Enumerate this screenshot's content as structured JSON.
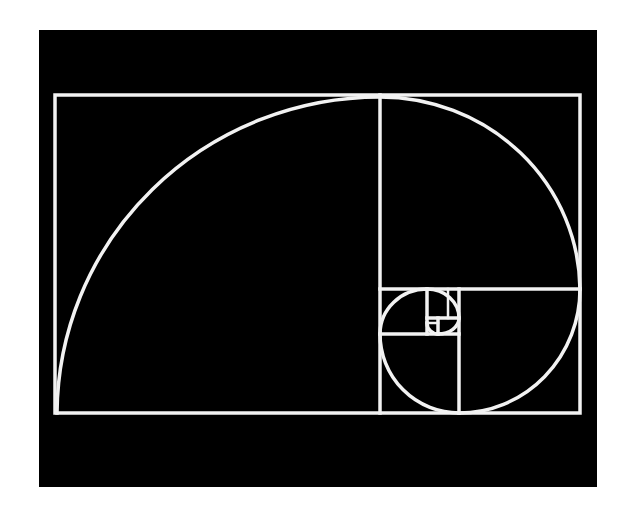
{
  "figure": {
    "title": "Golden rectangle with Fibonacci spiral",
    "background_color": "#000000",
    "line_color": "#f2f2f2",
    "page_color": "#ffffff"
  },
  "geometry": {
    "outer_rect": {
      "x": 55,
      "y": 95,
      "w": 525,
      "h": 318
    },
    "squares": [
      {
        "x": 55,
        "y": 95,
        "size_w": 325,
        "size_h": 318
      },
      {
        "x": 380,
        "y": 95,
        "size_w": 200,
        "size_h": 194
      },
      {
        "x": 459,
        "y": 289,
        "size_w": 121,
        "size_h": 124
      },
      {
        "x": 380,
        "y": 334,
        "size_w": 79,
        "size_h": 79
      },
      {
        "x": 380,
        "y": 289,
        "size_w": 47,
        "size_h": 45
      },
      {
        "x": 427,
        "y": 289,
        "size_w": 32,
        "size_h": 29
      },
      {
        "x": 438,
        "y": 318,
        "size_w": 21,
        "size_h": 16
      },
      {
        "x": 427,
        "y": 323,
        "size_w": 11,
        "size_h": 11
      }
    ]
  }
}
